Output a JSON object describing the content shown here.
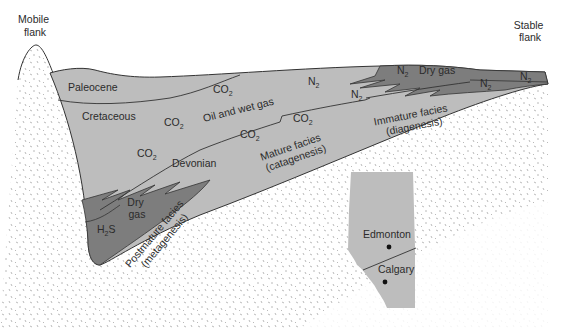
{
  "diagram": {
    "type": "geological-cross-section",
    "colors": {
      "background": "#ffffff",
      "basement_stipple": "#9a9a9a",
      "light_fill": "#bdbdbd",
      "dark_fill": "#7d7d7d",
      "outline": "#333333"
    },
    "flanks": {
      "left": [
        "Mobile",
        "flank"
      ],
      "right": [
        "Stable",
        "flank"
      ]
    },
    "formations": {
      "paleocene": "Paleocene",
      "cretaceous": "Cretaceous",
      "devonian": "Devonian"
    },
    "gases": {
      "co2_a": {
        "base": "CO",
        "sub": "2"
      },
      "co2_b": {
        "base": "CO",
        "sub": "2"
      },
      "co2_c": {
        "base": "CO",
        "sub": "2"
      },
      "co2_d": {
        "base": "CO",
        "sub": "2"
      },
      "co2_e": {
        "base": "CO",
        "sub": "2"
      },
      "n2_a": {
        "base": "N",
        "sub": "2"
      },
      "n2_b": {
        "base": "N",
        "sub": "2"
      },
      "n2_c": {
        "base": "N",
        "sub": "2"
      },
      "n2_d": {
        "base": "N",
        "sub": "2"
      },
      "n2_e": {
        "base": "N",
        "sub": "2"
      },
      "h2s": {
        "base": "H",
        "sub": "2",
        "tail": "S"
      },
      "oil_wet_gas": "Oil and wet gas",
      "dry_gas_top": "Dry gas",
      "dry_gas_deep": [
        "Dry",
        "gas"
      ]
    },
    "facies": {
      "immature": [
        "Immature facies",
        "(diagenesis)"
      ],
      "mature": [
        "Mature facies",
        "(catagenesis)"
      ],
      "postmature": [
        "Postmature facies",
        "(metagenesis)"
      ]
    },
    "inset_map": {
      "cities": [
        "Edmonton",
        "Calgary"
      ]
    }
  }
}
